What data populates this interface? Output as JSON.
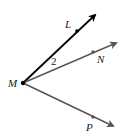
{
  "diagram": {
    "vertex": {
      "label": "M",
      "x": 23,
      "y": 83,
      "label_x": 9,
      "label_y": 87
    },
    "rays": [
      {
        "name": "ray-ML",
        "point_label": "L",
        "color": "#000000",
        "width": 1.8,
        "tip": [
          97,
          13
        ],
        "dot": [
          77,
          31
        ],
        "label_pos": [
          65,
          28
        ]
      },
      {
        "name": "ray-MN",
        "point_label": "N",
        "color": "#555555",
        "width": 1.4,
        "tip": [
          118,
          42
        ],
        "dot": [
          93,
          52
        ],
        "label_pos": [
          97,
          63
        ]
      },
      {
        "name": "ray-MP",
        "point_label": "P",
        "color": "#555555",
        "width": 1.4,
        "tip": [
          115,
          127
        ],
        "dot": [
          93,
          117
        ],
        "label_pos": [
          86,
          131
        ]
      }
    ],
    "angle_label": {
      "text": "2",
      "x": 51,
      "y": 65
    }
  }
}
